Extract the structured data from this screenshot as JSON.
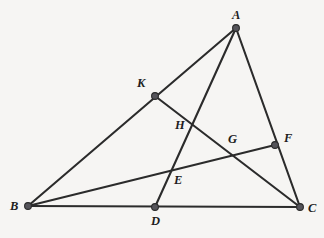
{
  "figure": {
    "canvas": {
      "width": 324,
      "height": 238
    },
    "background_color": "#f6f5f3",
    "line_color": "#2b2b2b",
    "vertex_fill_color": "#55545a",
    "label_color": "#1d1d1d"
  },
  "chart_data": {
    "type": "diagram",
    "points": [
      {
        "id": "A",
        "label": "A",
        "x": 236,
        "y": 28,
        "marked": true,
        "label_dx": -4,
        "label_dy": -19
      },
      {
        "id": "B",
        "label": "B",
        "x": 28,
        "y": 206,
        "marked": true,
        "label_dx": -18,
        "label_dy": -6
      },
      {
        "id": "C",
        "label": "C",
        "x": 300,
        "y": 207,
        "marked": true,
        "label_dx": 8,
        "label_dy": -5
      },
      {
        "id": "K",
        "label": "K",
        "x": 155,
        "y": 96,
        "marked": true,
        "label_dx": -18,
        "label_dy": -19
      },
      {
        "id": "D",
        "label": "D",
        "x": 155,
        "y": 207,
        "marked": true,
        "label_dx": -4,
        "label_dy": 8
      },
      {
        "id": "F",
        "label": "F",
        "x": 275,
        "y": 145,
        "marked": true,
        "label_dx": 9,
        "label_dy": -13
      },
      {
        "id": "G",
        "label": "G",
        "x": 232,
        "y": 151,
        "marked": false,
        "label_dx": -4,
        "label_dy": -18
      },
      {
        "id": "H",
        "label": "H",
        "x": 191,
        "y": 131,
        "marked": false,
        "label_dx": -16,
        "label_dy": -12
      },
      {
        "id": "E",
        "label": "E",
        "x": 172,
        "y": 171,
        "marked": false,
        "label_dx": 2,
        "label_dy": 3
      }
    ],
    "segments": [
      {
        "id": "BA",
        "from": "B",
        "to": "A",
        "passes_through": [
          "K"
        ]
      },
      {
        "id": "BC",
        "from": "B",
        "to": "C",
        "passes_through": [
          "D"
        ]
      },
      {
        "id": "BF",
        "from": "B",
        "to": "F",
        "passes_through": [
          "E",
          "G"
        ]
      },
      {
        "id": "AD",
        "from": "A",
        "to": "D",
        "passes_through": [
          "H",
          "E"
        ]
      },
      {
        "id": "AC",
        "from": "A",
        "to": "C",
        "passes_through": [
          "F"
        ]
      },
      {
        "id": "KC",
        "from": "K",
        "to": "C",
        "passes_through": [
          "H",
          "G"
        ]
      }
    ],
    "vertex_radius": 3.4
  }
}
